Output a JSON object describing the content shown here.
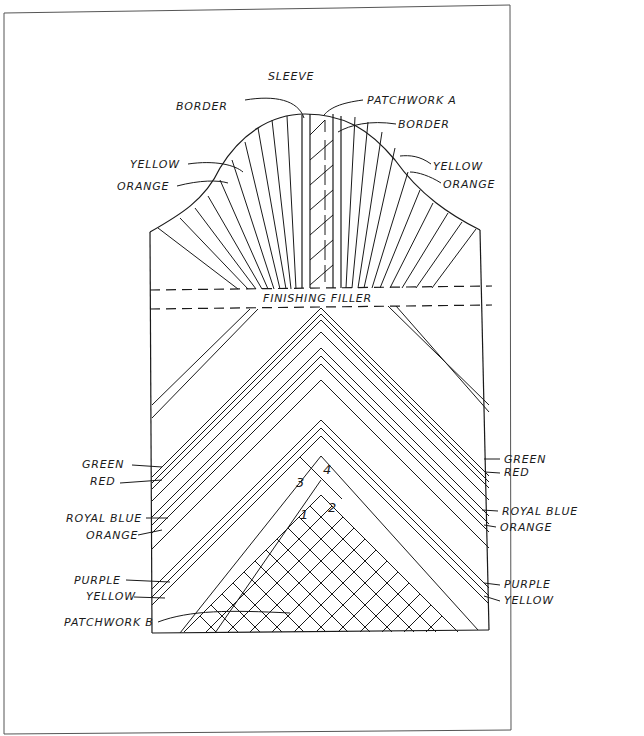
{
  "diagram": {
    "title": "SLEEVE",
    "top_labels": {
      "border_left": "BORDER",
      "patchwork_a": "PATCHWORK A",
      "border_right": "BORDER",
      "yellow_left": "YELLOW",
      "orange_left": "ORANGE",
      "yellow_right": "YELLOW",
      "orange_right": "ORANGE"
    },
    "filler_label": "FINISHING FILLER",
    "left_labels": [
      "GREEN",
      "RED",
      "ROYAL BLUE",
      "ORANGE",
      "PURPLE",
      "YELLOW"
    ],
    "right_labels": [
      "GREEN",
      "RED",
      "ROYAL BLUE",
      "ORANGE",
      "PURPLE",
      "YELLOW"
    ],
    "patchwork_b": "PATCHWORK B",
    "section_numbers": [
      "1",
      "2",
      "3",
      "4"
    ]
  }
}
